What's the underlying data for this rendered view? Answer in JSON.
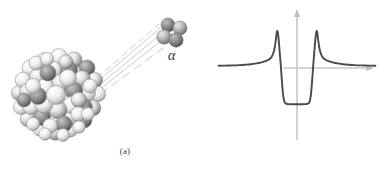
{
  "figure": {
    "background_color": "#ffffff",
    "width": 389,
    "height": 171
  },
  "panel_a": {
    "caption": "(a)",
    "alpha_label": "α",
    "nucleus": {
      "name": "nucleus-cluster",
      "description": "Cluster of shaded spherical nucleons forming a large sphere",
      "center_x": 60,
      "center_y": 95,
      "radius": 41,
      "nucleon_count": 52,
      "color_light": "#f2f2f2",
      "color_mid": "#b9b9b9",
      "color_dark": "#6e6e6e",
      "outline_color": "#8a8a8a"
    },
    "alpha_particle": {
      "name": "alpha-particle-cluster",
      "description": "Four shaded spheres representing two protons and two neutrons",
      "center_x": 171,
      "center_y": 33,
      "sphere_count": 4,
      "sphere_radius": 7
    },
    "trajectory_lines": {
      "name": "emission-trajectory-lines",
      "count": 5,
      "color": "#b5b5b5",
      "description": "Faint converging lines from nucleus surface to alpha particle"
    }
  },
  "panel_b": {
    "caption": "(b)",
    "axes": {
      "vertical_axis_x": 102,
      "vertical_axis_top": 12,
      "vertical_axis_bottom": 140,
      "horizontal_axis_y": 68,
      "horizontal_axis_left": 88,
      "horizontal_axis_right": 177,
      "axis_color": "#c4c4c4",
      "arrowheads": "both"
    },
    "curve": {
      "color": "#4a4a4a",
      "stroke_width": 1.9
    }
  },
  "chart_data": {
    "type": "line",
    "xlabel": "",
    "ylabel": "",
    "legend": [],
    "grid": false,
    "axis_origin_px": [
      297,
      68
    ],
    "features": {
      "well_depth_value": -0.72,
      "barrier_peak_value": 0.74,
      "well_inner_left_x": -0.48,
      "well_inner_right_x": 0.48,
      "barrier_left_x": -0.78,
      "barrier_right_x": 0.78,
      "tail_asymptote_value": 0.05
    },
    "x": [
      -2.8,
      -2.55,
      -2.3,
      -2.05,
      -1.85,
      -1.65,
      -1.45,
      -1.3,
      -1.15,
      -1.02,
      -0.95,
      -0.9,
      -0.86,
      -0.82,
      -0.79,
      -0.76,
      -0.74,
      -0.72,
      -0.7,
      -0.68,
      -0.65,
      -0.62,
      -0.58,
      -0.55,
      -0.52,
      -0.5,
      -0.47,
      -0.43,
      -0.38,
      -0.3,
      -0.2,
      -0.1,
      0.0,
      0.1,
      0.2,
      0.3,
      0.38,
      0.43,
      0.47,
      0.5,
      0.52,
      0.55,
      0.58,
      0.62,
      0.65,
      0.68,
      0.7,
      0.72,
      0.74,
      0.76,
      0.79,
      0.82,
      0.86,
      0.9,
      0.95,
      1.02,
      1.15,
      1.3,
      1.45,
      1.65,
      1.85,
      2.05,
      2.3,
      2.55,
      2.8
    ],
    "y": [
      0.045,
      0.048,
      0.052,
      0.058,
      0.066,
      0.076,
      0.092,
      0.108,
      0.132,
      0.165,
      0.195,
      0.232,
      0.278,
      0.345,
      0.43,
      0.545,
      0.64,
      0.72,
      0.74,
      0.69,
      0.54,
      0.33,
      0.06,
      -0.18,
      -0.4,
      -0.52,
      -0.63,
      -0.695,
      -0.715,
      -0.722,
      -0.725,
      -0.726,
      -0.726,
      -0.726,
      -0.725,
      -0.722,
      -0.715,
      -0.695,
      -0.63,
      -0.52,
      -0.4,
      -0.18,
      0.06,
      0.33,
      0.54,
      0.69,
      0.74,
      0.72,
      0.64,
      0.545,
      0.43,
      0.345,
      0.278,
      0.232,
      0.195,
      0.165,
      0.132,
      0.108,
      0.092,
      0.076,
      0.066,
      0.058,
      0.052,
      0.048,
      0.045
    ],
    "xlim": [
      -3.1,
      3.1
    ],
    "ylim": [
      -1.15,
      1.05
    ]
  }
}
